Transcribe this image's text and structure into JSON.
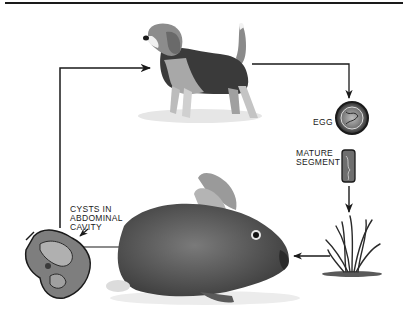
{
  "diagram": {
    "stages": [
      {
        "id": "dog",
        "label": "",
        "description": "Beagle dog (definitive host)"
      },
      {
        "id": "egg",
        "label": "EGG"
      },
      {
        "id": "mature_segment",
        "label_line1": "MATURE",
        "label_line2": "SEGMENT"
      },
      {
        "id": "grass",
        "label": "",
        "description": "Grass clump where segment falls"
      },
      {
        "id": "rabbit",
        "label": "",
        "description": "Rabbit (intermediate host) eating grass"
      },
      {
        "id": "cysts",
        "label_line1": "CYSTS IN",
        "label_line2": "ABDOMINAL",
        "label_line3": "CAVITY"
      }
    ],
    "flow": [
      "dog",
      "egg",
      "mature_segment",
      "grass",
      "rabbit",
      "cysts",
      "dog"
    ],
    "colors": {
      "line": "#1a1a1a",
      "background": "#ffffff"
    }
  }
}
